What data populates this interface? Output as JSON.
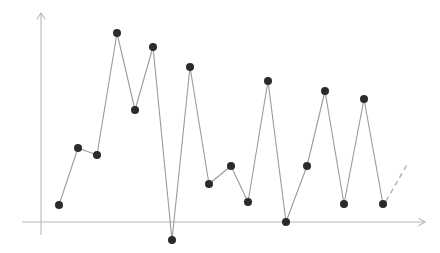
{
  "chart_data": {
    "type": "line",
    "title": "",
    "subtitle": "",
    "xlabel": "",
    "ylabel": "",
    "grid": false,
    "legend": null,
    "legend_position": "none",
    "axis_color": "#b8b8b8",
    "line_color": "#9a9a9a",
    "marker_color": "#2b2b2b",
    "trend_color": "#b0b0b0",
    "marker_radius_px": 4,
    "xlim": [
      0,
      20
    ],
    "ylim": [
      -1,
      11
    ],
    "x_axis_y_value": 0,
    "x": [
      1,
      2,
      3,
      4,
      5,
      6,
      7,
      8,
      9,
      10,
      11,
      12,
      13,
      14,
      15,
      16,
      17,
      18
    ],
    "values": [
      0.8,
      3.5,
      3.2,
      9.0,
      5.3,
      8.3,
      -0.85,
      7.3,
      1.8,
      2.6,
      0.95,
      6.6,
      0.0,
      2.6,
      6.2,
      0.85,
      5.8,
      0.85
    ],
    "series": [
      {
        "name": "series-1",
        "values": [
          0.8,
          3.5,
          3.2,
          9.0,
          5.3,
          8.3,
          -0.85,
          7.3,
          1.8,
          2.6,
          0.95,
          6.6,
          0.0,
          2.6,
          6.2,
          0.85,
          5.8,
          0.85
        ]
      }
    ],
    "annotations": [
      {
        "name": "trend-continuation",
        "style": "dashed",
        "from_x": 18,
        "from_y": 0.85,
        "to_x": 19.2,
        "to_y": 2.8
      }
    ],
    "pixel_points": [
      [
        59,
        205
      ],
      [
        78,
        148
      ],
      [
        97,
        155
      ],
      [
        117,
        33
      ],
      [
        135,
        110
      ],
      [
        153,
        47
      ],
      [
        172,
        240
      ],
      [
        190,
        67
      ],
      [
        209,
        184
      ],
      [
        231,
        166
      ],
      [
        248,
        202
      ],
      [
        268,
        81
      ],
      [
        286,
        222
      ],
      [
        307,
        166
      ],
      [
        325,
        91
      ],
      [
        344,
        204
      ],
      [
        364,
        99
      ],
      [
        383,
        204
      ]
    ],
    "dash_pixel_points": [
      [
        386,
        201
      ],
      [
        408,
        163
      ]
    ],
    "axes_pixels": {
      "y_axis_x": 41,
      "y_axis_top": 13,
      "y_axis_bottom": 235,
      "x_axis_y": 222,
      "x_axis_left": 22,
      "x_axis_right": 425
    }
  }
}
